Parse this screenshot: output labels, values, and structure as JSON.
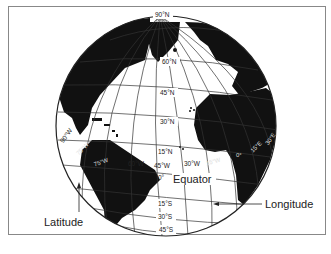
{
  "figure": {
    "callouts": {
      "latitude": "Latitude",
      "longitude": "Longitude",
      "equator": "Equator"
    },
    "latitude_labels": [
      "90°N",
      "60°N",
      "45°N",
      "30°N",
      "15°N",
      "0°",
      "15°S",
      "30°S",
      "45°S"
    ],
    "longitude_labels": [
      "90°W",
      "75°W",
      "60°W",
      "45°W",
      "30°W",
      "15°W",
      "0°",
      "15°E",
      "30°E"
    ],
    "colors": {
      "land": "#111111",
      "ocean": "#ffffff",
      "grid": "#333333",
      "frame": "#888888"
    }
  },
  "lat": {
    "n90": "90°N",
    "n60": "60°N",
    "n45": "45°N",
    "n30": "30°N",
    "n15": "15°N",
    "eq": "0°",
    "s15": "15°S",
    "s30": "30°S",
    "s45": "45°S"
  },
  "lon": {
    "w90": "90°W",
    "w75": "75°W",
    "w60": "60°W",
    "w45": "45°W",
    "w30": "30°W",
    "w15": "15°W",
    "e0": "0°",
    "e15": "15°E",
    "e30": "30°E"
  }
}
